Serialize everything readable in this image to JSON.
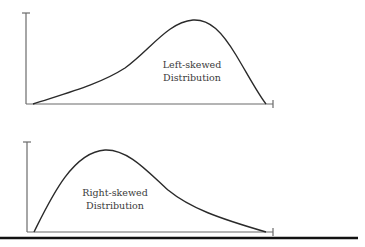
{
  "figure": {
    "panels": [
      {
        "id": "left-skewed",
        "label_line1": "Left-skewed",
        "label_line2": "Distribution",
        "skew": "left"
      },
      {
        "id": "right-skewed",
        "label_line1": "Right-skewed",
        "label_line2": "Distribution",
        "skew": "right"
      }
    ],
    "colors": {
      "curve": "#2a2a2a",
      "axis": "#6b6b6b",
      "text": "#3a3a3a",
      "rule": "#111111"
    }
  }
}
